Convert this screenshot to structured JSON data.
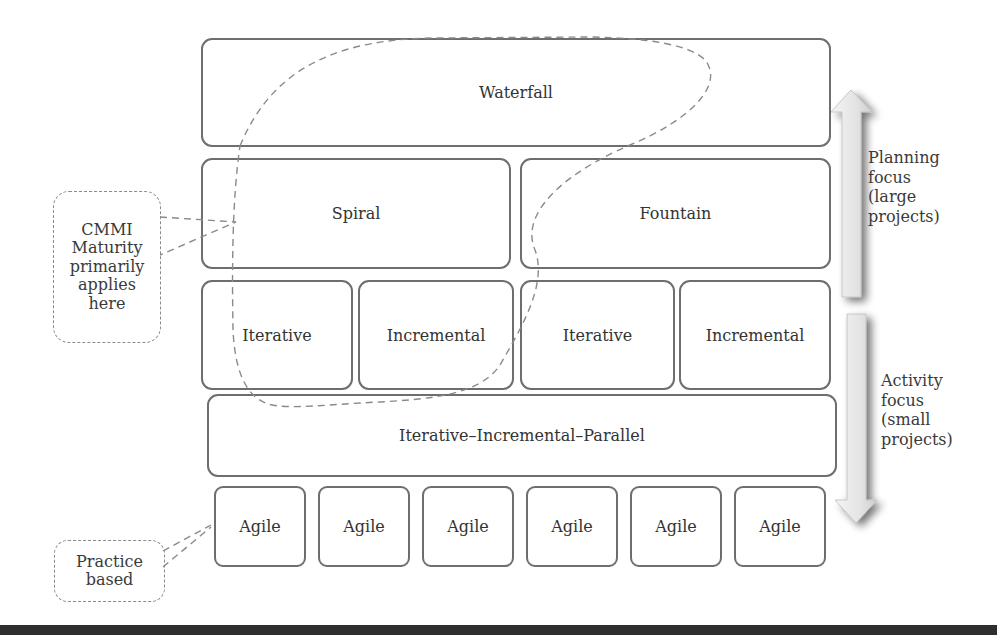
{
  "diagram": {
    "layers": {
      "waterfall": "Waterfall",
      "spiral": "Spiral",
      "fountain": "Fountain",
      "iterative_1": "Iterative",
      "incremental_1": "Incremental",
      "iterative_2": "Iterative",
      "incremental_2": "Incremental",
      "iterative_incremental_parallel": "Iterative–Incremental–Parallel",
      "agile": [
        "Agile",
        "Agile",
        "Agile",
        "Agile",
        "Agile",
        "Agile"
      ]
    },
    "callouts": {
      "cmmi": [
        "CMMI",
        "Maturity",
        "primarily",
        "applies",
        "here"
      ],
      "practice": [
        "Practice",
        "based"
      ]
    },
    "arrows": {
      "planning": {
        "direction": "up",
        "label": [
          "Planning",
          "focus",
          "(large",
          "projects)"
        ]
      },
      "activity": {
        "direction": "down",
        "label": [
          "Activity",
          "focus",
          "(small",
          "projects)"
        ]
      }
    },
    "colors": {
      "box_border": "#6e6e6e",
      "dashed_line": "#8a8a8a",
      "arrow_fill": "#e6e6e6",
      "arrow_shadow": "#9a9a9a",
      "bottom_bar": "#2e2e2e"
    }
  }
}
